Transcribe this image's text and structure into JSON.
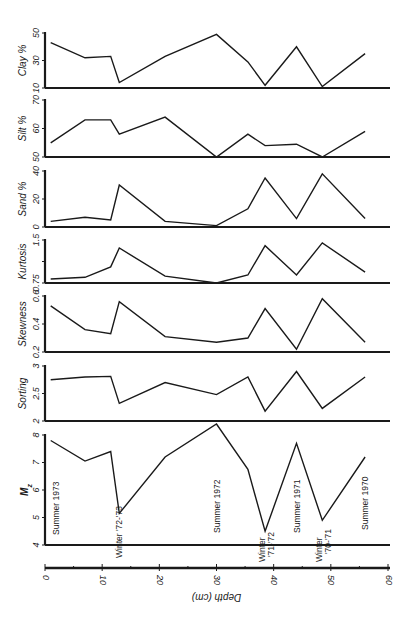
{
  "chart_data": {
    "type": "line",
    "layout": "stacked-panels",
    "x": [
      1,
      7,
      11.5,
      13,
      21,
      30,
      35.5,
      38.5,
      44,
      48.5,
      56
    ],
    "xlabel": "Depth (cm)",
    "xlim": [
      0,
      60
    ],
    "xticks": [
      0,
      10,
      20,
      30,
      40,
      50,
      60
    ],
    "grid": false,
    "legend": null,
    "panels": [
      {
        "name": "clay",
        "ylabel": "Clay %",
        "ylim": [
          10,
          50
        ],
        "yticks": [
          10,
          30,
          50
        ],
        "values": [
          43,
          32,
          33,
          14,
          33,
          49,
          29,
          12,
          40,
          11,
          35
        ]
      },
      {
        "name": "silt",
        "ylabel": "Silt %",
        "ylim": [
          50,
          70
        ],
        "yticks": [
          50,
          60,
          70
        ],
        "values": [
          55,
          63,
          63,
          58,
          64,
          50,
          58,
          54,
          54.5,
          50,
          59
        ]
      },
      {
        "name": "sand",
        "ylabel": "Sand %",
        "ylim": [
          0,
          40
        ],
        "yticks": [
          0,
          20,
          40
        ],
        "values": [
          4,
          7,
          5,
          30,
          4,
          1,
          13,
          35,
          6,
          38,
          6
        ]
      },
      {
        "name": "kurtosis",
        "ylabel": "Kurtosis",
        "ylim": [
          0.75,
          1.5
        ],
        "yticks": [
          0.75,
          1.5
        ],
        "yticks_minor": [
          1.125
        ],
        "values": [
          0.82,
          0.85,
          1.03,
          1.36,
          0.87,
          0.75,
          0.89,
          1.4,
          0.89,
          1.45,
          0.94
        ]
      },
      {
        "name": "skewness",
        "ylabel": "Skewness",
        "ylim": [
          0.2,
          0.6
        ],
        "yticks": [
          0.2,
          0.4,
          0.6
        ],
        "values": [
          0.53,
          0.36,
          0.33,
          0.56,
          0.31,
          0.27,
          0.3,
          0.51,
          0.22,
          0.58,
          0.27
        ]
      },
      {
        "name": "sorting",
        "ylabel": "Sorting",
        "ylim": [
          2,
          3
        ],
        "yticks": [
          2,
          2.5,
          3
        ],
        "values": [
          2.75,
          2.8,
          2.81,
          2.32,
          2.7,
          2.48,
          2.8,
          2.18,
          2.9,
          2.23,
          2.8
        ]
      },
      {
        "name": "mz",
        "ylabel": "Mz",
        "ylabel_sub": "z",
        "ylim": [
          4,
          8
        ],
        "yticks": [
          4,
          5,
          6,
          7,
          8
        ],
        "values": [
          7.8,
          7.05,
          7.4,
          5.15,
          7.2,
          8.4,
          6.75,
          4.5,
          7.7,
          4.9,
          7.2
        ]
      }
    ],
    "annotations": [
      {
        "text": "Summer 1973",
        "x": 2,
        "panel": "mz"
      },
      {
        "text": "Winter '72-'73",
        "x": 13,
        "panel": "mz"
      },
      {
        "text": "Summer 1972",
        "x": 30,
        "panel": "mz"
      },
      {
        "text": "Winter",
        "x": 38,
        "panel": "mz"
      },
      {
        "text": "'71-'72",
        "x": 39.5,
        "panel": "mz"
      },
      {
        "text": "Summer 1971",
        "x": 44,
        "panel": "mz"
      },
      {
        "text": "Winter",
        "x": 48,
        "panel": "mz"
      },
      {
        "text": "'70-'71",
        "x": 49.5,
        "panel": "mz"
      },
      {
        "text": "Summer 1970",
        "x": 56,
        "panel": "mz"
      }
    ]
  },
  "style": {
    "line_color": "#1a1a1a",
    "background": "#ffffff"
  }
}
